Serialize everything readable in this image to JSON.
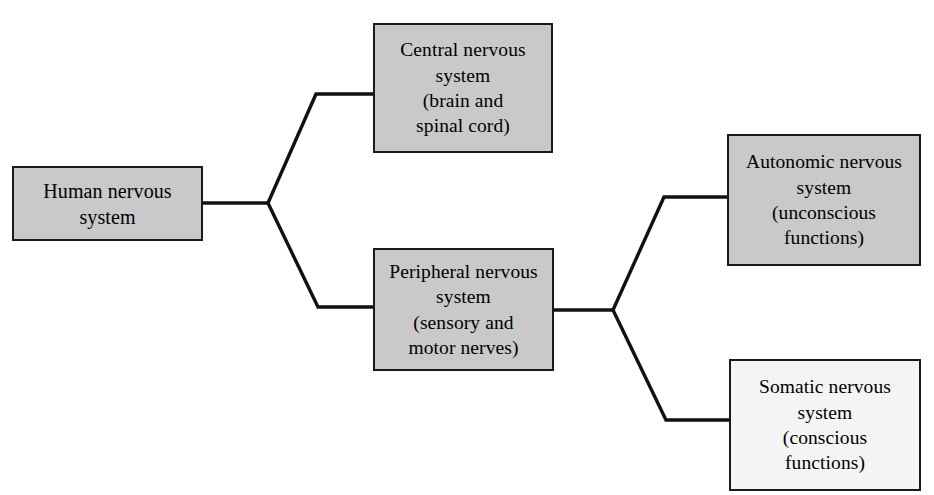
{
  "diagram": {
    "title": "Human nervous system",
    "type": "hierarchy-tree",
    "orientation": "left-to-right",
    "canvas": {
      "width": 934,
      "height": 495
    },
    "colors": {
      "box_fill_gray": "#c9c9c9",
      "box_fill_light": "#f4f4f4",
      "box_border": "#1a1a1a",
      "connector_line": "#111111",
      "background": "#ffffff",
      "text": "#000000"
    },
    "nodes": [
      {
        "id": "human-nervous-system",
        "label": "Human nervous\nsystem",
        "level": 0,
        "fill": "gray",
        "x": 12,
        "y": 166,
        "width": 191,
        "height": 75
      },
      {
        "id": "central-nervous-system",
        "label": "Central nervous\nsystem\n(brain and\nspinal cord)",
        "level": 1,
        "fill": "gray",
        "x": 373,
        "y": 23,
        "width": 180,
        "height": 130
      },
      {
        "id": "peripheral-nervous-system",
        "label": "Peripheral nervous\nsystem\n(sensory and\nmotor nerves)",
        "level": 1,
        "fill": "gray",
        "x": 373,
        "y": 248,
        "width": 181,
        "height": 123
      },
      {
        "id": "autonomic-nervous-system",
        "label": "Autonomic nervous\nsystem\n(unconscious\nfunctions)",
        "level": 2,
        "fill": "gray",
        "x": 727,
        "y": 134,
        "width": 194,
        "height": 132
      },
      {
        "id": "somatic-nervous-system",
        "label": "Somatic nervous\nsystem\n(conscious\nfunctions)",
        "level": 2,
        "fill": "light",
        "x": 729,
        "y": 359,
        "width": 192,
        "height": 132
      }
    ],
    "edges": [
      {
        "id": "edge-human-to-central",
        "from": "human-nervous-system",
        "to": "central-nervous-system"
      },
      {
        "id": "edge-human-to-peripheral",
        "from": "human-nervous-system",
        "to": "peripheral-nervous-system"
      },
      {
        "id": "edge-peripheral-to-autonomic",
        "from": "peripheral-nervous-system",
        "to": "autonomic-nervous-system"
      },
      {
        "id": "edge-peripheral-to-somatic",
        "from": "peripheral-nervous-system",
        "to": "somatic-nervous-system"
      }
    ]
  }
}
